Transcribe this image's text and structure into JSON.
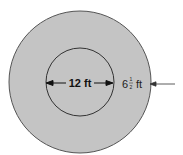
{
  "diagram": {
    "inner_label": "12 ft",
    "outer_label_whole": "6",
    "outer_label_frac_num": "1",
    "outer_label_frac_den": "2",
    "outer_label_unit": "ft",
    "colors": {
      "fill": "#c4c4c4",
      "stroke": "#3a3a3a",
      "text": "#111111"
    }
  }
}
